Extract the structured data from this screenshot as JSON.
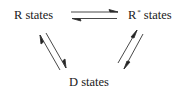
{
  "diagram": {
    "nodes": {
      "r": {
        "label": "R states"
      },
      "rstar": {
        "base": "R",
        "superscript": "*",
        "rest": "states"
      },
      "d": {
        "label": "D states"
      }
    },
    "edges": [
      {
        "from": "R states",
        "to": "R* states",
        "type": "reversible-equilibrium"
      },
      {
        "from": "R states",
        "to": "D states",
        "type": "reversible-equilibrium"
      },
      {
        "from": "R* states",
        "to": "D states",
        "type": "reversible-equilibrium"
      }
    ],
    "colors": {
      "text": "#1a1a1a",
      "arrow": "#333333"
    }
  }
}
